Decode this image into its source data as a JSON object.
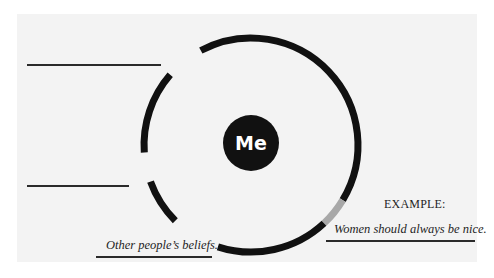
{
  "diagram": {
    "center_label": "Me",
    "example_heading": "EXAMPLE:",
    "example_text": "Women should always be nice.",
    "bottom_label": "Other people’s beliefs.",
    "blank_lines": [
      {
        "id": "top-left-blank",
        "value": ""
      },
      {
        "id": "middle-left-blank",
        "value": ""
      }
    ]
  },
  "colors": {
    "background": "#ffffff",
    "paper": "#f3f3f3",
    "ring": "#111111",
    "ring_highlight": "#a8a8a8",
    "center_fill": "#111111",
    "center_text": "#ffffff"
  },
  "ring": {
    "center": [
      251,
      145
    ],
    "radius": 107,
    "stroke_width": 7,
    "segments": [
      {
        "name": "main-arc",
        "start_deg": -118,
        "end_deg": 31,
        "color": "ring"
      },
      {
        "name": "highlight-arc",
        "start_deg": 31,
        "end_deg": 47,
        "color": "ring_highlight"
      },
      {
        "name": "bottom-arc",
        "start_deg": 47,
        "end_deg": 108,
        "color": "ring"
      },
      {
        "name": "left-upper-arc",
        "start_deg": 176,
        "end_deg": 221,
        "color": "ring"
      },
      {
        "name": "left-lower-arc",
        "start_deg": 135,
        "end_deg": 160,
        "color": "ring"
      }
    ]
  }
}
